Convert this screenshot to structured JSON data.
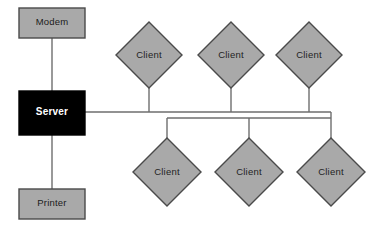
{
  "diagram": {
    "type": "network-topology",
    "colors": {
      "node_fill": "#a9a9a9",
      "node_stroke": "#4a4a4a",
      "server_fill": "#000000",
      "server_text": "#ffffff",
      "node_text": "#1f1f1f",
      "line": "#6e6e6e",
      "background": "#ffffff"
    },
    "bus": {
      "upper_y": 112,
      "lower_y": 118,
      "upper_x_start": 85,
      "upper_x_end": 331,
      "lower_x_start": 167,
      "lower_x_end": 331
    },
    "boxes": [
      {
        "id": "modem",
        "label": "Modem",
        "x": 19,
        "y": 8,
        "w": 66,
        "h": 30,
        "style": "gray"
      },
      {
        "id": "server",
        "label": "Server",
        "x": 19,
        "y": 91,
        "w": 66,
        "h": 44,
        "style": "black"
      },
      {
        "id": "printer",
        "label": "Printer",
        "x": 19,
        "y": 189,
        "w": 66,
        "h": 30,
        "style": "gray"
      }
    ],
    "diamonds": [
      {
        "id": "client-top-1",
        "label": "Client",
        "cx": 149,
        "cy": 55,
        "r": 33,
        "row": "top"
      },
      {
        "id": "client-top-2",
        "label": "Client",
        "cx": 231,
        "cy": 55,
        "r": 33,
        "row": "top"
      },
      {
        "id": "client-top-3",
        "label": "Client",
        "cx": 309,
        "cy": 55,
        "r": 33,
        "row": "top"
      },
      {
        "id": "client-bottom-1",
        "label": "Client",
        "cx": 167,
        "cy": 172,
        "r": 34,
        "row": "bottom"
      },
      {
        "id": "client-bottom-2",
        "label": "Client",
        "cx": 249,
        "cy": 172,
        "r": 34,
        "row": "bottom"
      },
      {
        "id": "client-bottom-3",
        "label": "Client",
        "cx": 331,
        "cy": 172,
        "r": 34,
        "row": "bottom"
      }
    ],
    "connectors": [
      {
        "id": "modem-to-server",
        "from": "modem",
        "to": "server",
        "orientation": "vertical"
      },
      {
        "id": "server-to-printer",
        "from": "server",
        "to": "printer",
        "orientation": "vertical"
      },
      {
        "id": "server-to-bus",
        "from": "server",
        "to": "bus",
        "orientation": "horizontal"
      },
      {
        "id": "bus-to-client-top-1",
        "from": "bus",
        "to": "client-top-1",
        "orientation": "vertical"
      },
      {
        "id": "bus-to-client-top-2",
        "from": "bus",
        "to": "client-top-2",
        "orientation": "vertical"
      },
      {
        "id": "bus-to-client-top-3",
        "from": "bus",
        "to": "client-top-3",
        "orientation": "vertical"
      },
      {
        "id": "bus-to-client-bottom-1",
        "from": "bus",
        "to": "client-bottom-1",
        "orientation": "vertical"
      },
      {
        "id": "bus-to-client-bottom-2",
        "from": "bus",
        "to": "client-bottom-2",
        "orientation": "vertical"
      },
      {
        "id": "bus-to-client-bottom-3",
        "from": "bus",
        "to": "client-bottom-3",
        "orientation": "vertical"
      }
    ]
  }
}
